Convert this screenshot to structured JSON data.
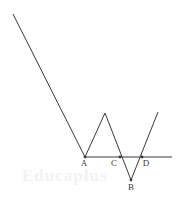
{
  "figure": {
    "type": "line-diagram",
    "background_color": "#ffffff",
    "stroke_color": "#3a3a3a",
    "stroke_width": 1,
    "canvas": {
      "width": 180,
      "height": 211
    },
    "watermark_text": "Educaplus",
    "watermark_color": "#f2f2f2",
    "zigzag_path": {
      "name": "zigzag-polyline",
      "points": [
        {
          "x": 13,
          "y": 14
        },
        {
          "x": 85,
          "y": 157
        },
        {
          "x": 105,
          "y": 113
        },
        {
          "x": 131,
          "y": 180
        },
        {
          "x": 158,
          "y": 112
        }
      ]
    },
    "horizontal_line": {
      "name": "baseline",
      "x1": 85,
      "y1": 157,
      "x2": 172,
      "y2": 157
    },
    "points": [
      {
        "id": "A",
        "label": "A",
        "x": 85,
        "y": 157,
        "label_x": 84,
        "label_y": 166
      },
      {
        "id": "C",
        "label": "C",
        "x": 120,
        "y": 157,
        "label_x": 114,
        "label_y": 166
      },
      {
        "id": "D",
        "label": "D",
        "x": 142,
        "y": 157,
        "label_x": 146,
        "label_y": 166
      },
      {
        "id": "B",
        "label": "B",
        "x": 131,
        "y": 180,
        "label_x": 131,
        "label_y": 190
      }
    ],
    "label_font_size": 9
  }
}
